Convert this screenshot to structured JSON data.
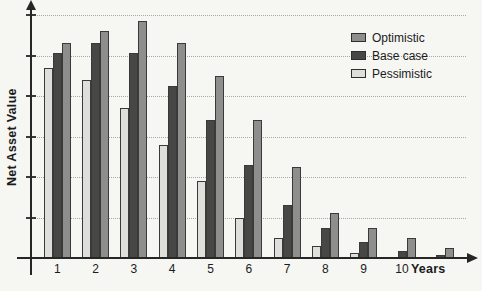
{
  "figure": {
    "ylabel": "Net Asset Value",
    "xlabel": "Years"
  },
  "legend": {
    "position": "top-right",
    "items": [
      {
        "label": "Optimistic",
        "color": "#8e8e8c"
      },
      {
        "label": "Base case",
        "color": "#474745"
      },
      {
        "label": "Pessimistic",
        "color": "#dededa"
      }
    ]
  },
  "chart_data": {
    "type": "bar",
    "title": "",
    "xlabel": "Years",
    "ylabel": "Net Asset Value",
    "categories": [
      "1",
      "2",
      "3",
      "4",
      "5",
      "6",
      "7",
      "8",
      "9",
      "10",
      ""
    ],
    "series": [
      {
        "name": "Pessimistic",
        "color": "#dededa",
        "values": [
          4.7,
          4.4,
          3.7,
          2.8,
          1.9,
          1.0,
          0.5,
          0.3,
          0.12,
          0,
          0
        ]
      },
      {
        "name": "Base case",
        "color": "#474745",
        "values": [
          5.05,
          5.3,
          5.05,
          4.25,
          3.4,
          2.3,
          1.3,
          0.75,
          0.4,
          0.17,
          0.08
        ]
      },
      {
        "name": "Optimistic",
        "color": "#8e8e8c",
        "values": [
          5.3,
          5.6,
          5.85,
          5.3,
          4.5,
          3.4,
          2.25,
          1.1,
          0.75,
          0.5,
          0.25
        ]
      }
    ],
    "ylim": [
      0,
      6.3
    ],
    "y_tick_labels": "none",
    "gridline_values": [
      1,
      2,
      3,
      4,
      5,
      6
    ],
    "grid": "dotted-horizontal",
    "legend_position": "top-right",
    "axis_arrows": [
      "x-right",
      "y-up"
    ]
  }
}
